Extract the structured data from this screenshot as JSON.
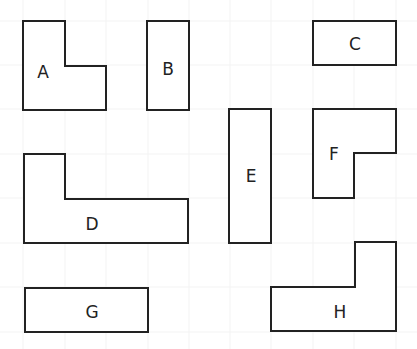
{
  "diagram": {
    "title": "",
    "grid": {
      "color": "#f3f3f3",
      "xs": [
        23,
        65,
        106,
        148,
        189,
        230,
        271,
        313,
        354,
        396
      ],
      "ys": [
        21,
        65,
        109,
        154,
        198,
        243,
        287,
        332
      ]
    },
    "stroke_color": "#222222",
    "shapes": [
      {
        "id": "A",
        "label": "A",
        "type": "L-shape",
        "points": "23,21 65,21 65,66 106,66 106,110 23,110",
        "label_x": 43,
        "label_y": 72
      },
      {
        "id": "B",
        "label": "B",
        "type": "rectangle",
        "points": "147,21 189,21 189,110 147,110",
        "label_x": 168,
        "label_y": 69
      },
      {
        "id": "C",
        "label": "C",
        "type": "rectangle",
        "points": "313,21 396,21 396,65 313,65",
        "label_x": 355,
        "label_y": 44
      },
      {
        "id": "D",
        "label": "D",
        "type": "L-shape",
        "points": "24,154 65,154 65,199 188,199 188,243 24,243",
        "label_x": 92,
        "label_y": 224
      },
      {
        "id": "E",
        "label": "E",
        "type": "rectangle",
        "points": "229,109 271,109 271,243 229,243",
        "label_x": 251,
        "label_y": 176
      },
      {
        "id": "F",
        "label": "F",
        "type": "L-shape",
        "points": "313,109 396,109 396,153 354,153 354,198 313,198",
        "label_x": 334,
        "label_y": 154
      },
      {
        "id": "G",
        "label": "G",
        "type": "rectangle",
        "points": "25,288 148,288 148,332 25,332",
        "label_x": 92,
        "label_y": 312
      },
      {
        "id": "H",
        "label": "H",
        "type": "L-shape",
        "points": "271,287 355,287 355,242 396,242 396,331 271,331",
        "label_x": 340,
        "label_y": 312
      }
    ]
  }
}
